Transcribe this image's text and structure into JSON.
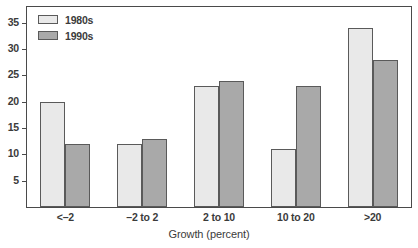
{
  "chart_data": {
    "type": "bar",
    "title": "",
    "subtitle": "",
    "xlabel": "Growth (percent)",
    "ylabel": "",
    "categories": [
      "<–2",
      "–2 to 2",
      "2 to 10",
      "10 to 20",
      ">20"
    ],
    "series": [
      {
        "name": "1980s",
        "values": [
          20,
          12,
          23,
          11,
          34
        ],
        "color": "#e9e9e9"
      },
      {
        "name": "1990s",
        "values": [
          12,
          13,
          24,
          23,
          28
        ],
        "color": "#a9a9a9"
      }
    ],
    "ylim": [
      0,
      38
    ],
    "yticks": [
      5,
      10,
      15,
      20,
      25,
      30,
      35
    ],
    "ytick_labels": [
      "5",
      "10",
      "15",
      "20",
      "25",
      "30",
      "35"
    ],
    "grid": false,
    "legend_position": "top-left-inside",
    "frame": true,
    "bar_edge_color": "#5a5a5a",
    "axis_color": "#4a4a4a",
    "text_color": "#3b3b3b",
    "background": "#ffffff"
  }
}
